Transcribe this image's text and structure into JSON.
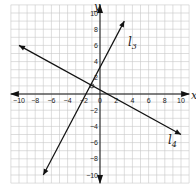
{
  "graph": {
    "x_axis_label": "x",
    "y_axis_label": "y",
    "x_ticks": [
      "−10",
      "−8",
      "−6",
      "−4",
      "−2",
      "0",
      "2",
      "4",
      "6",
      "8",
      "10"
    ],
    "y_ticks": [
      "10",
      "8",
      "6",
      "4",
      "2",
      "−2",
      "−4",
      "−6",
      "−8",
      "−10"
    ],
    "lines": [
      {
        "name": "l",
        "subscript": "3",
        "from": [
          -7,
          -10
        ],
        "to": [
          3,
          9
        ]
      },
      {
        "name": "l",
        "subscript": "4",
        "from": [
          -10,
          6
        ],
        "to": [
          10,
          -5
        ]
      }
    ],
    "grid_range": {
      "x": [
        -11,
        11
      ],
      "y": [
        -11,
        11
      ]
    }
  }
}
